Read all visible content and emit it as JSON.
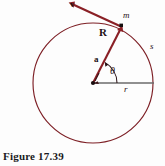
{
  "figure": {
    "caption": "Figure 17.39",
    "labels": {
      "velocity": "v",
      "mass": "m",
      "position_vector": "R",
      "arc_length": "s",
      "acceleration": "a",
      "angle": "θ",
      "radius": "r"
    },
    "colors": {
      "curve": "#7d1f25",
      "vector": "#8a2026",
      "axis": "#6b6b6b",
      "text": "#1a1012",
      "caption": "#1a1a22",
      "background": "#fdfdfd"
    },
    "geometry": {
      "circle_center_x": 93,
      "circle_center_y": 83,
      "circle_radius": 60,
      "mass_point_x": 122,
      "mass_point_y": 27,
      "velocity_tip_x": 69,
      "velocity_tip_y": 3,
      "horizontal_radius_end_x": 154,
      "horizontal_radius_end_y": 83,
      "angle_degrees": 62
    }
  }
}
